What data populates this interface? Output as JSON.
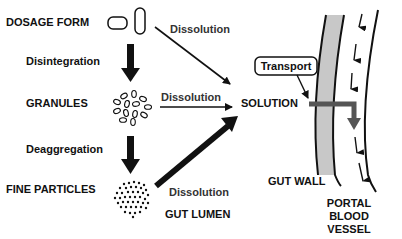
{
  "diagram": {
    "stages": {
      "dosage_form": "DOSAGE FORM",
      "granules": "GRANULES",
      "fine_particles": "FINE PARTICLES",
      "solution": "SOLUTION"
    },
    "processes": {
      "disintegration": "Disintegration",
      "deaggregation": "Deaggregation",
      "dissolution_1": "Dissolution",
      "dissolution_2": "Dissolution",
      "dissolution_3": "Dissolution",
      "transport": "Transport"
    },
    "regions": {
      "gut_lumen": "GUT LUMEN",
      "gut_wall": "GUT WALL",
      "portal_line1": "PORTAL",
      "portal_line2": "BLOOD",
      "portal_line3": "VESSEL"
    },
    "colors": {
      "ink": "#111111",
      "gut_wall_fill": "#c8c8c8",
      "transport_arrow": "#555555"
    }
  }
}
